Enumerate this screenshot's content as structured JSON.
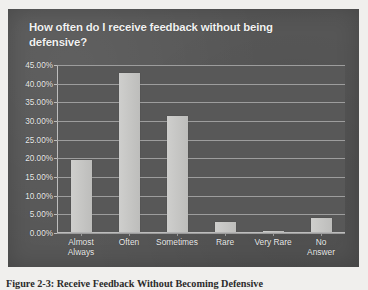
{
  "chart_panel": {
    "title": "How often do I receive feedback without being defensive?",
    "background_color": "#575757",
    "bar_color": "#c9c9c7",
    "gridline_color": "#a9a9a9",
    "text_color": "#f2f2f2"
  },
  "figure": {
    "caption": "Figure 2-3: Receive Feedback Without Becoming Defensive"
  },
  "chart_data": {
    "type": "bar",
    "title": "How often do I receive feedback without being defensive?",
    "xlabel": "",
    "ylabel": "",
    "categories": [
      "Almost Always",
      "Often",
      "Sometimes",
      "Rare",
      "Very Rare",
      "No Answer"
    ],
    "category_labels_wrapped": [
      "Almost\nAlways",
      "Often",
      "Sometimes",
      "Rare",
      "Very Rare",
      "No Answer"
    ],
    "values": [
      19.3,
      42.5,
      31.0,
      2.7,
      0.2,
      3.8
    ],
    "value_labels": [
      "19.30%",
      "42.50%",
      "31.00%",
      "2.70%",
      "0.20%",
      "3.80%"
    ],
    "ylim": [
      0,
      45
    ],
    "ytick_values": [
      45,
      40,
      35,
      30,
      25,
      20,
      15,
      10,
      5,
      0
    ],
    "ytick_labels": [
      "45.00%",
      "40.00%",
      "35.00%",
      "30.00%",
      "25.00%",
      "20.00%",
      "15.00%",
      "10.00%",
      "5.00%",
      "0.00%"
    ],
    "grid": true,
    "legend": false,
    "legend_position": "none",
    "series": [
      {
        "name": "Percent of responses",
        "values": [
          19.3,
          42.5,
          31.0,
          2.7,
          0.2,
          3.8
        ]
      }
    ]
  }
}
